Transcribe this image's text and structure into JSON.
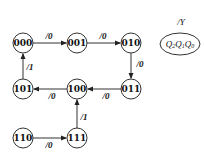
{
  "diagram": {
    "type": "state-transition-diagram",
    "states": [
      {
        "id": "s000",
        "label": "000",
        "x": 23,
        "y": 43
      },
      {
        "id": "s001",
        "label": "001",
        "x": 77,
        "y": 43
      },
      {
        "id": "s010",
        "label": "010",
        "x": 131,
        "y": 43
      },
      {
        "id": "s011",
        "label": "011",
        "x": 131,
        "y": 89
      },
      {
        "id": "s100",
        "label": "100",
        "x": 77,
        "y": 89
      },
      {
        "id": "s101",
        "label": "101",
        "x": 23,
        "y": 89
      },
      {
        "id": "s110",
        "label": "110",
        "x": 23,
        "y": 138
      },
      {
        "id": "s111",
        "label": "111",
        "x": 77,
        "y": 138
      }
    ],
    "transitions": [
      {
        "from": "000",
        "to": "001",
        "label": "/0"
      },
      {
        "from": "001",
        "to": "010",
        "label": "/0"
      },
      {
        "from": "010",
        "to": "011",
        "label": "/0"
      },
      {
        "from": "011",
        "to": "100",
        "label": "/0"
      },
      {
        "from": "100",
        "to": "101",
        "label": "/0"
      },
      {
        "from": "101",
        "to": "000",
        "label": "/1"
      },
      {
        "from": "110",
        "to": "111",
        "label": "/0"
      },
      {
        "from": "111",
        "to": "100",
        "label": "/1"
      }
    ],
    "legend": {
      "output_label": "/Y",
      "state_vars": [
        "Q",
        "2",
        "Q",
        "1",
        "Q",
        "0"
      ]
    }
  }
}
